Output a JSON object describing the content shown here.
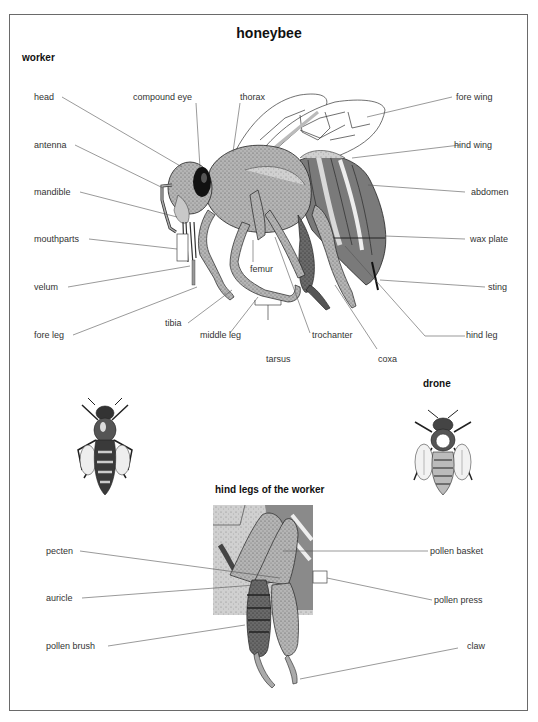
{
  "header": {
    "cutoff_text": "HONEYBEE ANATOMY"
  },
  "diagram": {
    "title": "honeybee",
    "sections": {
      "worker": "worker",
      "drone": "drone",
      "hind_legs": "hind legs of the worker"
    },
    "worker_labels": {
      "head": "head",
      "compound_eye": "compound eye",
      "thorax": "thorax",
      "fore_wing": "fore wing",
      "antenna": "antenna",
      "hind_wing": "hind wing",
      "mandible": "mandible",
      "abdomen": "abdomen",
      "mouthparts": "mouthparts",
      "wax_plate": "wax plate",
      "femur": "femur",
      "velum": "velum",
      "sting": "sting",
      "tibia": "tibia",
      "fore_leg": "fore leg",
      "middle_leg": "middle leg",
      "trochanter": "trochanter",
      "hind_leg": "hind leg",
      "tarsus": "tarsus",
      "coxa": "coxa"
    },
    "hind_leg_labels": {
      "pecten": "pecten",
      "pollen_basket": "pollen basket",
      "auricle": "auricle",
      "pollen_press": "pollen press",
      "pollen_brush": "pollen brush",
      "claw": "claw"
    },
    "colors": {
      "frame": "#6a6a6a",
      "leader_line": "#555555",
      "body_light": "#bdbdbd",
      "body_mid": "#8f8f8f",
      "body_dark": "#4a4a4a",
      "eye": "#111111"
    }
  }
}
